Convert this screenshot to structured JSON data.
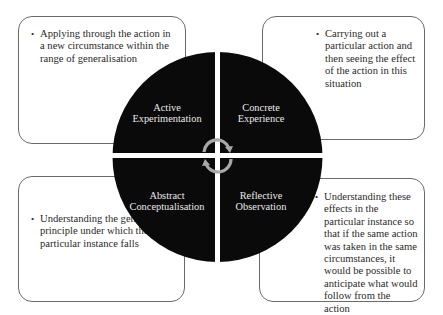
{
  "diagram": {
    "quadrants": [
      {
        "id": "active",
        "label_line1": "Active",
        "label_line2": "Experimentation",
        "position": "top-left"
      },
      {
        "id": "concrete",
        "label_line1": "Concrete",
        "label_line2": "Experience",
        "position": "top-right"
      },
      {
        "id": "abstract",
        "label_line1": "Abstract",
        "label_line2": "Conceptualisation",
        "position": "bottom-left"
      },
      {
        "id": "reflective",
        "label_line1": "Reflective",
        "label_line2": "Observation",
        "position": "bottom-right"
      }
    ],
    "boxes": {
      "top_left": "Applying through the action in a new circumstance within the range of generalisation",
      "top_right": "Carrying out a particular action and then seeing the effect of the action in this situation",
      "bottom_left": "Understanding the general principle under which the particular instance falls",
      "bottom_right": "Understanding these effects in the particular instance so that if the same action was taken in the same circumstances, it would be possible to anticipate what would follow from the action"
    },
    "center_icon": "cycle-arrows-icon",
    "colors": {
      "circle": "#0a0a0a",
      "label_text": "#e8e8e8",
      "arrow": "#a8a8a8",
      "box_border": "#6a6a6a"
    }
  }
}
